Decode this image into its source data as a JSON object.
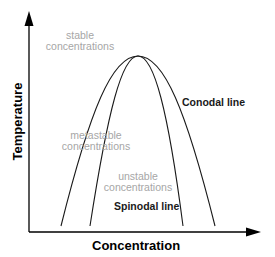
{
  "diagram": {
    "type": "phase-diagram",
    "axes": {
      "x_label": "Concentration",
      "y_label": "Temperature"
    },
    "curves": [
      {
        "name": "Conodal line",
        "role": "outer-binodal"
      },
      {
        "name": "Spinodal line",
        "role": "inner-spinodal"
      }
    ],
    "regions": {
      "stable": {
        "line1": "stable",
        "line2": "concentrations"
      },
      "metastable": {
        "line1": "metastable",
        "line2": "concentrations"
      },
      "unstable": {
        "line1": "unstable",
        "line2": "concentrations"
      }
    },
    "labels": {
      "conodal": "Conodal line",
      "spinodal": "Spinodal line"
    },
    "colors": {
      "axis": "#000000",
      "curve": "#1a1a1a",
      "region_text": "#a6a6a6",
      "line_label": "#1a1a1a"
    }
  }
}
